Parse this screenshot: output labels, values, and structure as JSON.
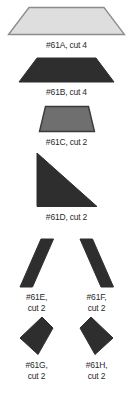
{
  "document": {
    "title": "Quilt Pattern Piece Template Sheet",
    "background_color": "#ffffff"
  },
  "colors": {
    "light_fill": "#dedede",
    "light_stroke": "#8c8c8c",
    "dark_fill": "#2e2e2e",
    "dark_stroke": "#2e2e2e",
    "medium_fill": "#6f6f6f",
    "medium_stroke": "#3a3a3a",
    "label_color": "#2b2b2b"
  },
  "pieces": [
    {
      "id": "61A",
      "label": "#61A, cut 4",
      "shape": "trapezoid",
      "shade": "light",
      "cut_count": 4
    },
    {
      "id": "61B",
      "label": "#61B, cut 4",
      "shape": "trapezoid",
      "shade": "dark",
      "cut_count": 4
    },
    {
      "id": "61C",
      "label": "#61C, cut 2",
      "shape": "trapezoid",
      "shade": "medium",
      "cut_count": 2
    },
    {
      "id": "61D",
      "label": "#61D, cut 2",
      "shape": "right-triangle",
      "shade": "dark",
      "cut_count": 2
    },
    {
      "id": "61E",
      "label": "#61E,\ncut 2",
      "shape": "parallelogram-left",
      "shade": "dark",
      "cut_count": 2
    },
    {
      "id": "61F",
      "label": "#61F,\ncut 2",
      "shape": "parallelogram-right",
      "shade": "dark",
      "cut_count": 2
    },
    {
      "id": "61G",
      "label": "#61G,\ncut 2",
      "shape": "kite-left",
      "shade": "dark",
      "cut_count": 2
    },
    {
      "id": "61H",
      "label": "#61H,\ncut 2",
      "shape": "kite-right",
      "shade": "dark",
      "cut_count": 2
    }
  ]
}
